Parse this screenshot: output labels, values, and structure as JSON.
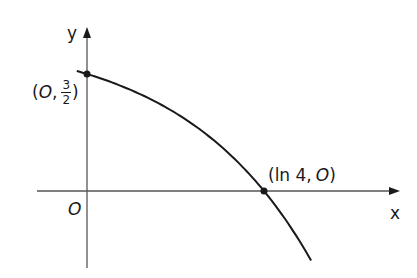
{
  "diagram": {
    "type": "function-graph",
    "function": "y = 2 - (1/2)e^x",
    "axes": {
      "x_label": "x",
      "y_label": "y",
      "origin_label": "O"
    },
    "points": [
      {
        "name": "y-intercept",
        "open": "(",
        "x_text": "O",
        "sep": ",",
        "frac_num": "3",
        "frac_den": "2",
        "close": ")",
        "x": 0,
        "y": 1.5
      },
      {
        "name": "x-intercept",
        "label": "(ln 4, O)",
        "open": "(",
        "x_text": "ln 4",
        "sep": ",",
        "y_text": "O",
        "close": ")",
        "x": 1.386,
        "y": 0
      }
    ],
    "colors": {
      "stroke": "#1a1a1a",
      "axis": "#555555",
      "background": "#ffffff"
    }
  },
  "chart_data": {
    "type": "line",
    "title": "",
    "xlabel": "x",
    "ylabel": "y",
    "series": [
      {
        "name": "curve",
        "x": [
          -0.08,
          0,
          0.5,
          1.0,
          1.386,
          1.75
        ],
        "y": [
          1.54,
          1.5,
          1.18,
          0.64,
          0,
          -0.88
        ]
      }
    ],
    "annotations": [
      "(O, 3/2)",
      "(ln 4, O)",
      "O"
    ],
    "grid": false
  }
}
